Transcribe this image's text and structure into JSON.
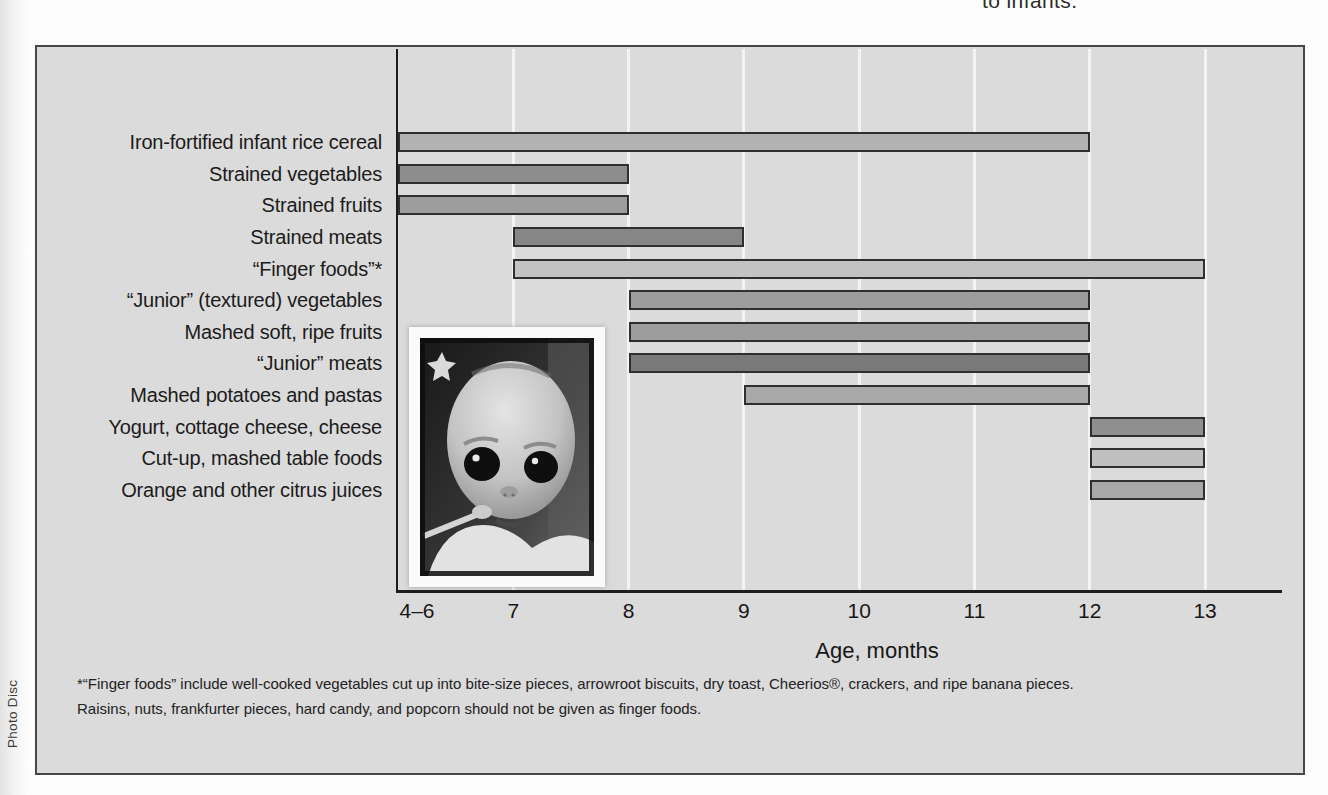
{
  "page": {
    "top_text_fragment": "to infants.",
    "photo_credit": "Photo Disc"
  },
  "chart_data": {
    "type": "bar",
    "subtype": "horizontal-range-gantt",
    "title": "",
    "xlabel": "Age, months",
    "ylabel": "",
    "x_axis_range_months": [
      6,
      13.7
    ],
    "grid": "vertical white gridlines at each month tick",
    "background_color": "#dbdbdb",
    "legend": "none",
    "x_ticks": [
      {
        "label": "4–6",
        "month": 6
      },
      {
        "label": "7",
        "month": 7
      },
      {
        "label": "8",
        "month": 8
      },
      {
        "label": "9",
        "month": 9
      },
      {
        "label": "10",
        "month": 10
      },
      {
        "label": "11",
        "month": 11
      },
      {
        "label": "12",
        "month": 12
      },
      {
        "label": "13",
        "month": 13
      }
    ],
    "items": [
      {
        "label": "Iron-fortified infant rice cereal",
        "start": 6,
        "end": 12,
        "start_tick": "4–6",
        "end_tick": "12",
        "color": "#b3b3b3"
      },
      {
        "label": "Strained vegetables",
        "start": 6,
        "end": 8,
        "start_tick": "4–6",
        "end_tick": "8",
        "color": "#8d8d8d"
      },
      {
        "label": "Strained fruits",
        "start": 6,
        "end": 8,
        "start_tick": "4–6",
        "end_tick": "8",
        "color": "#9d9d9d"
      },
      {
        "label": "Strained meats",
        "start": 7,
        "end": 9,
        "start_tick": "7",
        "end_tick": "9",
        "color": "#868686"
      },
      {
        "label": "“Finger foods”*",
        "start": 7,
        "end": 13,
        "start_tick": "7",
        "end_tick": "13",
        "color": "#c3c3c3"
      },
      {
        "label": "“Junior” (textured) vegetables",
        "start": 8,
        "end": 12,
        "start_tick": "8",
        "end_tick": "12",
        "color": "#9d9d9d"
      },
      {
        "label": "Mashed soft, ripe fruits",
        "start": 8,
        "end": 12,
        "start_tick": "8",
        "end_tick": "12",
        "color": "#9d9d9d"
      },
      {
        "label": "“Junior” meats",
        "start": 8,
        "end": 12,
        "start_tick": "8",
        "end_tick": "12",
        "color": "#797979"
      },
      {
        "label": "Mashed potatoes and pastas",
        "start": 9,
        "end": 12,
        "start_tick": "9",
        "end_tick": "12",
        "color": "#a8a8a8"
      },
      {
        "label": "Yogurt, cottage cheese, cheese",
        "start": 12,
        "end": 13,
        "start_tick": "12",
        "end_tick": "13",
        "color": "#8f8f8f"
      },
      {
        "label": "Cut-up, mashed table foods",
        "start": 12,
        "end": 13,
        "start_tick": "12",
        "end_tick": "13",
        "color": "#c0c0c0"
      },
      {
        "label": "Orange and other citrus juices",
        "start": 12,
        "end": 13,
        "start_tick": "12",
        "end_tick": "13",
        "color": "#a8a8a8"
      }
    ],
    "footnote": [
      "*“Finger foods” include well-cooked vegetables cut up into bite-size pieces, arrowroot biscuits, dry toast, Cheerios®, crackers, and ripe banana pieces.",
      "Raisins, nuts, frankfurter pieces, hard candy, and popcorn should not be given as finger foods."
    ],
    "inset_photo": "black-and-white close-up photo of a baby's face with a spoon"
  }
}
